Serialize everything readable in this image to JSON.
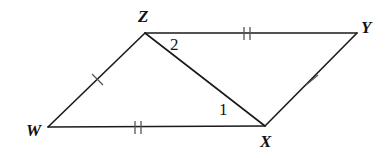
{
  "figure": {
    "kind": "geometry-diagram",
    "background_color": "#ffffff",
    "stroke_color": "#1a1a1a",
    "stroke_width": 1.6
  },
  "vertices": [
    {
      "name": "W",
      "label": "W",
      "x": 48,
      "y": 127
    },
    {
      "name": "X",
      "label": "X",
      "x": 265,
      "y": 126
    },
    {
      "name": "Y",
      "label": "Y",
      "x": 357,
      "y": 33
    },
    {
      "name": "Z",
      "label": "Z",
      "x": 145,
      "y": 33
    }
  ],
  "segments": [
    {
      "name": "WZ",
      "from": "W",
      "to": "Z",
      "x1": 48,
      "y1": 127,
      "x2": 145,
      "y2": 33,
      "ticks": 1
    },
    {
      "name": "ZY",
      "from": "Z",
      "to": "Y",
      "x1": 145,
      "y1": 33,
      "x2": 357,
      "y2": 33,
      "ticks": 2
    },
    {
      "name": "YX",
      "from": "Y",
      "to": "X",
      "x1": 357,
      "y1": 33,
      "x2": 265,
      "y2": 126,
      "ticks": 1
    },
    {
      "name": "XW",
      "from": "X",
      "to": "W",
      "x1": 265,
      "y1": 126,
      "x2": 48,
      "y2": 127,
      "ticks": 2
    },
    {
      "name": "ZX",
      "from": "Z",
      "to": "X",
      "x1": 145,
      "y1": 33,
      "x2": 265,
      "y2": 126,
      "ticks": 0
    }
  ],
  "tick_marks": [
    {
      "name": "tick-WZ",
      "on_segment": "WZ",
      "count": 1,
      "cx": 97,
      "cy": 80
    },
    {
      "name": "tick-ZY",
      "on_segment": "ZY",
      "count": 2,
      "cx": 247,
      "cy": 33
    },
    {
      "name": "tick-YX",
      "on_segment": "YX",
      "count": 1,
      "cx": 312,
      "cy": 80
    },
    {
      "name": "tick-XW",
      "on_segment": "XW",
      "count": 2,
      "cx": 138,
      "cy": 127
    }
  ],
  "angle_labels": [
    {
      "name": "angle-1",
      "label": "1",
      "at_vertex": "X",
      "x": 225,
      "y": 110
    },
    {
      "name": "angle-2",
      "label": "2",
      "at_vertex": "Z",
      "x": 177,
      "y": 45
    }
  ]
}
